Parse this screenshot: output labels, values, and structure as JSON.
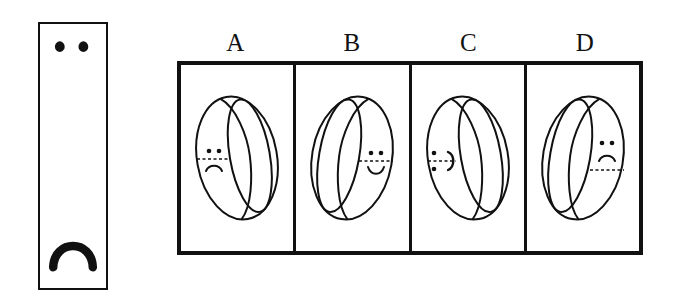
{
  "figure": {
    "type": "spatial-reasoning-multiple-choice",
    "stroke_color": "#111111",
    "background_color": "#ffffff"
  },
  "stimulus": {
    "name": "flat-strip-with-face",
    "description": "Tall narrow rectangle showing two eye dots near the top and a downward-opening arc (frown) near the bottom",
    "eyes_count": 2,
    "mouth": "frown-arc"
  },
  "options": [
    {
      "letter": "A",
      "ring_tilt": "hole-right",
      "face_side": "left",
      "face_expression": "sad",
      "face_rotation": "upright",
      "seam_line": "dashed-horizontal-through-eyes"
    },
    {
      "letter": "B",
      "ring_tilt": "hole-left",
      "face_side": "right",
      "face_expression": "smile",
      "face_rotation": "upright",
      "seam_line": "dashed-horizontal-through-eyes"
    },
    {
      "letter": "C",
      "ring_tilt": "hole-right",
      "face_side": "left",
      "face_expression": "sideways",
      "face_rotation": "rotated-90",
      "seam_line": "dashed-horizontal-through-mouth"
    },
    {
      "letter": "D",
      "ring_tilt": "hole-left",
      "face_side": "right",
      "face_expression": "sad",
      "face_rotation": "upright",
      "seam_line": "dashed-horizontal-below-mouth"
    }
  ]
}
